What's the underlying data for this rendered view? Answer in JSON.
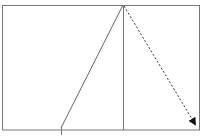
{
  "diagram": {
    "frame": {
      "x": 2,
      "y": 5,
      "width": 197,
      "height": 125,
      "stroke": "#777777"
    },
    "apex": {
      "x": 123,
      "y": 5
    },
    "vertical_line": {
      "x1": 123,
      "y1": 5,
      "x2": 123,
      "y2": 130,
      "stroke": "#777777"
    },
    "solid_line": {
      "x1": 123,
      "y1": 5,
      "x2": 61,
      "y2": 128,
      "stroke": "#666666"
    },
    "base_tick": {
      "x1": 61,
      "y1": 126,
      "x2": 61,
      "y2": 135,
      "stroke": "#777777"
    },
    "dashed_arrow": {
      "x1": 123,
      "y1": 6,
      "x2": 196,
      "y2": 126,
      "stroke": "#333333",
      "head": "arrowhead"
    }
  }
}
